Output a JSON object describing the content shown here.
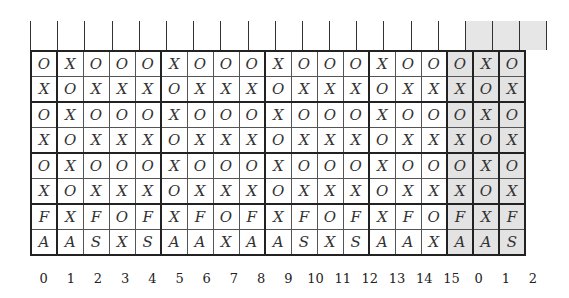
{
  "diagram": {
    "rows": [
      [
        "O",
        "X",
        "O",
        "O",
        "O",
        "X",
        "O",
        "O",
        "O",
        "X",
        "O",
        "O",
        "O",
        "X",
        "O",
        "O",
        "O",
        "X",
        "O"
      ],
      [
        "X",
        "O",
        "X",
        "X",
        "X",
        "O",
        "X",
        "X",
        "X",
        "O",
        "X",
        "X",
        "X",
        "O",
        "X",
        "X",
        "X",
        "O",
        "X"
      ],
      [
        "O",
        "X",
        "O",
        "O",
        "O",
        "X",
        "O",
        "O",
        "O",
        "X",
        "O",
        "O",
        "O",
        "X",
        "O",
        "O",
        "O",
        "X",
        "O"
      ],
      [
        "X",
        "O",
        "X",
        "X",
        "X",
        "O",
        "X",
        "X",
        "X",
        "O",
        "X",
        "X",
        "X",
        "O",
        "X",
        "X",
        "X",
        "O",
        "X"
      ],
      [
        "O",
        "X",
        "O",
        "O",
        "O",
        "X",
        "O",
        "O",
        "O",
        "X",
        "O",
        "O",
        "O",
        "X",
        "O",
        "O",
        "O",
        "X",
        "O"
      ],
      [
        "X",
        "O",
        "X",
        "X",
        "X",
        "O",
        "X",
        "X",
        "X",
        "O",
        "X",
        "X",
        "X",
        "O",
        "X",
        "X",
        "X",
        "O",
        "X"
      ],
      [
        "F",
        "X",
        "F",
        "O",
        "F",
        "X",
        "F",
        "O",
        "F",
        "X",
        "F",
        "O",
        "F",
        "X",
        "F",
        "O",
        "F",
        "X",
        "F"
      ],
      [
        "A",
        "A",
        "S",
        "X",
        "S",
        "A",
        "A",
        "X",
        "A",
        "A",
        "S",
        "X",
        "S",
        "A",
        "A",
        "X",
        "A",
        "A",
        "S"
      ]
    ],
    "column_labels": [
      "0",
      "1",
      "2",
      "3",
      "4",
      "5",
      "6",
      "7",
      "8",
      "9",
      "10",
      "11",
      "12",
      "13",
      "14",
      "15",
      "0",
      "1",
      "2"
    ],
    "shaded_columns": [
      16,
      17,
      18
    ],
    "colors": {
      "shade": "#e3e3e3",
      "border": "#222222",
      "text": "#333333"
    }
  }
}
